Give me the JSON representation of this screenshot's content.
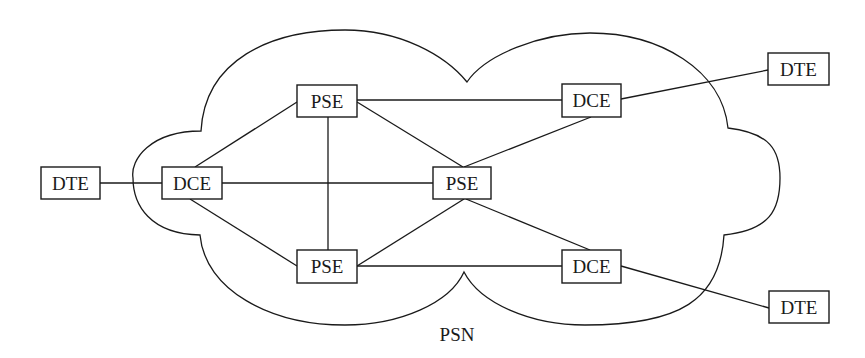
{
  "diagram": {
    "network_label": "PSN",
    "nodes": [
      {
        "id": "dte_left",
        "label": "DTE",
        "x": 41,
        "y": 167,
        "w": 59,
        "h": 32
      },
      {
        "id": "dce_left",
        "label": "DCE",
        "x": 162,
        "y": 167,
        "w": 60,
        "h": 32
      },
      {
        "id": "pse_top",
        "label": "PSE",
        "x": 297,
        "y": 85,
        "w": 60,
        "h": 32
      },
      {
        "id": "pse_center",
        "label": "PSE",
        "x": 433,
        "y": 167,
        "w": 58,
        "h": 32
      },
      {
        "id": "pse_bottom",
        "label": "PSE",
        "x": 297,
        "y": 250,
        "w": 60,
        "h": 33
      },
      {
        "id": "dce_top_right",
        "label": "DCE",
        "x": 562,
        "y": 84,
        "w": 59,
        "h": 33
      },
      {
        "id": "dce_bottom_right",
        "label": "DCE",
        "x": 562,
        "y": 250,
        "w": 59,
        "h": 33
      },
      {
        "id": "dte_top_right",
        "label": "DTE",
        "x": 768,
        "y": 53,
        "w": 61,
        "h": 32
      },
      {
        "id": "dte_bottom_right",
        "label": "DTE",
        "x": 769,
        "y": 291,
        "w": 60,
        "h": 32
      }
    ],
    "edges": [
      {
        "from": "dte_left",
        "to": "dce_left"
      },
      {
        "from": "dce_left",
        "to": "pse_top"
      },
      {
        "from": "dce_left",
        "to": "pse_center"
      },
      {
        "from": "dce_left",
        "to": "pse_bottom"
      },
      {
        "from": "pse_top",
        "to": "pse_bottom"
      },
      {
        "from": "pse_top",
        "to": "dce_top_right"
      },
      {
        "from": "pse_top",
        "to": "pse_center"
      },
      {
        "from": "pse_center",
        "to": "dce_top_right"
      },
      {
        "from": "pse_center",
        "to": "pse_bottom"
      },
      {
        "from": "pse_center",
        "to": "dce_bottom_right"
      },
      {
        "from": "pse_bottom",
        "to": "dce_bottom_right"
      },
      {
        "from": "dce_top_right",
        "to": "dte_top_right"
      },
      {
        "from": "dce_bottom_right",
        "to": "dte_bottom_right"
      }
    ]
  }
}
